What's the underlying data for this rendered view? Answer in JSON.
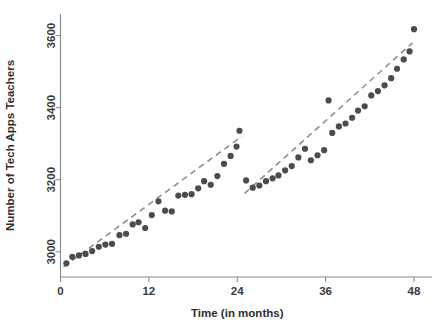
{
  "chart_data": {
    "type": "scatter",
    "title": "",
    "xlabel": "Time (in months)",
    "ylabel": "Number of Tech Apps Teachers",
    "xlim": [
      0,
      48
    ],
    "ylim": [
      2930,
      3660
    ],
    "xticks": [
      0,
      12,
      24,
      36,
      48
    ],
    "yticks": [
      3000,
      3200,
      3400,
      3600
    ],
    "xtick_labels": [
      "0",
      "12",
      "24",
      "36",
      "48"
    ],
    "ytick_labels": [
      "3000",
      "3200",
      "3400",
      "3600"
    ],
    "grid": false,
    "legend": "none",
    "point_color": "#4c4c4c",
    "trend_color": "#8e8e8e",
    "axis_color": "#8a8a8a",
    "series": [
      {
        "name": "Segment 1 (months 0-24)",
        "marker": "circle",
        "points": [
          [
            0.8,
            2968
          ],
          [
            1.6,
            2986
          ],
          [
            2.5,
            2990
          ],
          [
            3.4,
            2994
          ],
          [
            4.3,
            3002
          ],
          [
            5.2,
            3014
          ],
          [
            6.1,
            3020
          ],
          [
            7.0,
            3022
          ],
          [
            8.0,
            3046
          ],
          [
            8.9,
            3050
          ],
          [
            9.8,
            3076
          ],
          [
            10.6,
            3082
          ],
          [
            11.5,
            3066
          ],
          [
            12.4,
            3102
          ],
          [
            13.3,
            3140
          ],
          [
            14.2,
            3114
          ],
          [
            15.1,
            3112
          ],
          [
            16.0,
            3156
          ],
          [
            16.9,
            3158
          ],
          [
            17.8,
            3160
          ],
          [
            18.7,
            3176
          ],
          [
            19.5,
            3196
          ],
          [
            20.4,
            3186
          ],
          [
            21.3,
            3210
          ],
          [
            22.2,
            3244
          ],
          [
            23.1,
            3266
          ],
          [
            23.9,
            3292
          ],
          [
            24.3,
            3336
          ]
        ],
        "trend": [
          [
            0.4,
            2958
          ],
          [
            24.6,
            3320
          ]
        ]
      },
      {
        "name": "Segment 2 (months 25-48)",
        "marker": "circle",
        "points": [
          [
            25.2,
            3198
          ],
          [
            26.1,
            3178
          ],
          [
            27.0,
            3184
          ],
          [
            27.9,
            3196
          ],
          [
            28.8,
            3204
          ],
          [
            29.6,
            3212
          ],
          [
            30.5,
            3226
          ],
          [
            31.4,
            3238
          ],
          [
            32.3,
            3262
          ],
          [
            33.2,
            3286
          ],
          [
            34.0,
            3254
          ],
          [
            34.9,
            3268
          ],
          [
            35.8,
            3282
          ],
          [
            36.4,
            3420
          ],
          [
            36.9,
            3330
          ],
          [
            37.8,
            3348
          ],
          [
            38.7,
            3356
          ],
          [
            39.6,
            3372
          ],
          [
            40.4,
            3392
          ],
          [
            41.3,
            3404
          ],
          [
            42.2,
            3434
          ],
          [
            43.1,
            3446
          ],
          [
            44.0,
            3462
          ],
          [
            44.9,
            3482
          ],
          [
            45.7,
            3508
          ],
          [
            46.6,
            3534
          ],
          [
            47.4,
            3556
          ],
          [
            48.0,
            3618
          ]
        ],
        "trend": [
          [
            25.0,
            3162
          ],
          [
            47.8,
            3580
          ]
        ]
      }
    ]
  }
}
